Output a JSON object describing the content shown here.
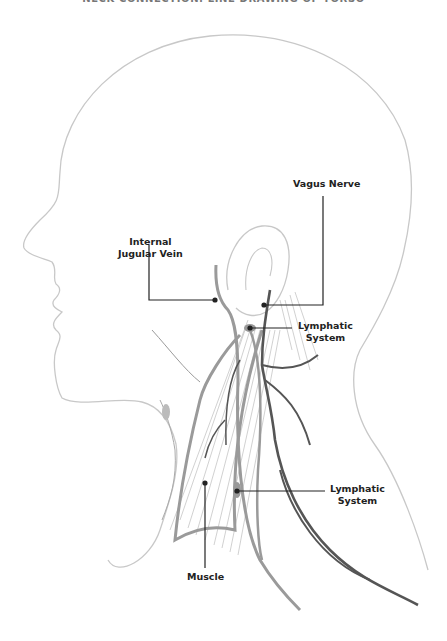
{
  "title": "NECK CONNECTION: LINE DRAWING OF TORSO",
  "labels": {
    "vagus_nerve": "Vagus Nerve",
    "internal_jugular_vein_1": "Internal",
    "internal_jugular_vein_2": "Jugular Vein",
    "lymphatic_upper_1": "Lymphatic",
    "lymphatic_upper_2": "System",
    "lymphatic_lower_1": "Lymphatic",
    "lymphatic_lower_2": "System",
    "muscle": "Muscle"
  },
  "colors": {
    "outline": "#c8c8c8",
    "structure": "#9a9a9a",
    "nerve": "#555555",
    "leader": "#222222"
  }
}
